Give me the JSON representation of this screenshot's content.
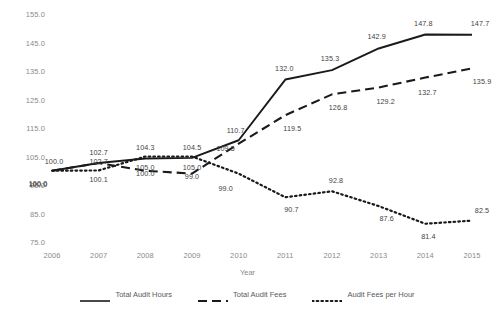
{
  "chart_data": {
    "type": "line",
    "title": "",
    "xlabel": "Year",
    "ylabel": "",
    "categories": [
      "2006",
      "2007",
      "2008",
      "2009",
      "2010",
      "2011",
      "2012",
      "2013",
      "2014",
      "2015"
    ],
    "x": [
      2006,
      2007,
      2008,
      2009,
      2010,
      2011,
      2012,
      2013,
      2014,
      2015
    ],
    "ylim": [
      75.0,
      155.0
    ],
    "ytick_labels": [
      "155.0",
      "145.0",
      "135.0",
      "125.0",
      "115.0",
      "105.0",
      "95.0",
      "85.0",
      "75.0"
    ],
    "yticks": [
      155.0,
      145.0,
      135.0,
      125.0,
      115.0,
      105.0,
      95.0,
      85.0,
      75.0
    ],
    "grid": false,
    "legend_position": "bottom",
    "series": [
      {
        "name": "Total Audit Hours",
        "style": "solid",
        "color": "#1a1a1a",
        "values": [
          100.0,
          102.7,
          104.3,
          104.5,
          110.7,
          132.0,
          135.3,
          142.9,
          147.8,
          147.7
        ],
        "labels": [
          "100.0",
          "102.7",
          "104.3",
          "104.5",
          "110.7",
          "132.0",
          "135.3",
          "142.9",
          "147.8",
          "147.7"
        ]
      },
      {
        "name": "Total Audit Fees",
        "style": "dashed",
        "color": "#1a1a1a",
        "values": [
          100.0,
          102.7,
          100.0,
          99.0,
          109.5,
          119.5,
          126.8,
          129.2,
          132.7,
          135.9
        ],
        "labels": [
          "100.0",
          "102.7",
          "100.0",
          "99.0",
          "109.5",
          "119.5",
          "126.8",
          "129.2",
          "132.7",
          "135.9"
        ]
      },
      {
        "name": "Audit Fees per Hour",
        "style": "dotted",
        "color": "#1a1a1a",
        "values": [
          100.0,
          100.1,
          105.0,
          105.0,
          99.0,
          90.7,
          92.8,
          87.6,
          81.4,
          82.5
        ],
        "labels": [
          "100.0",
          "100.1",
          "105.0",
          "105.0",
          "99.0",
          "90.7",
          "92.8",
          "87.6",
          "81.4",
          "82.5"
        ]
      }
    ]
  },
  "legend": {
    "items": [
      {
        "label": "Total Audit Hours",
        "style": "solid"
      },
      {
        "label": "Total Audit Fees",
        "style": "dashed"
      },
      {
        "label": "Audit Fees per Hour",
        "style": "dotted"
      }
    ]
  },
  "axes": {
    "x_title": "Year"
  }
}
